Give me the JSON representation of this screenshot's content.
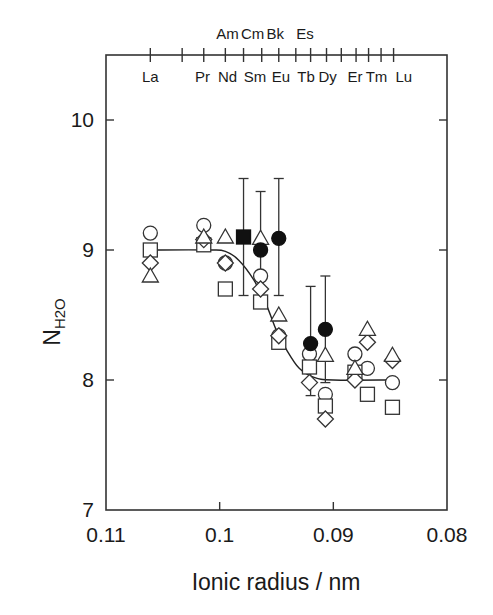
{
  "chart_data": {
    "type": "scatter",
    "title": "",
    "xlabel": "Ionic radius / nm",
    "ylabel_main": "N",
    "ylabel_sub": "H2O",
    "xlim": [
      0.11,
      0.08
    ],
    "ylim": [
      7,
      10.5
    ],
    "xticks": [
      {
        "value": 0.11,
        "label": "0.11"
      },
      {
        "value": 0.1,
        "label": "0.1"
      },
      {
        "value": 0.09,
        "label": "0.09"
      },
      {
        "value": 0.08,
        "label": "0.08"
      }
    ],
    "yticks": [
      {
        "value": 7,
        "label": "7"
      },
      {
        "value": 8,
        "label": "8"
      },
      {
        "value": 9,
        "label": "9"
      },
      {
        "value": 10,
        "label": "10"
      }
    ],
    "top_axis": {
      "tick_radii": [
        0.1061,
        0.1033,
        0.1014,
        0.0995,
        0.0979,
        0.0963,
        0.0948,
        0.0933,
        0.092,
        0.0906,
        0.0893,
        0.088,
        0.0869,
        0.0858,
        0.0847
      ],
      "lanthanide_labels": [
        {
          "label": "La",
          "r": 0.1061
        },
        {
          "label": "Pr",
          "r": 0.1015
        },
        {
          "label": "Nd",
          "r": 0.0993
        },
        {
          "label": "Sm",
          "r": 0.0969
        },
        {
          "label": "Eu",
          "r": 0.0946
        },
        {
          "label": "Tb",
          "r": 0.0924
        },
        {
          "label": "Dy",
          "r": 0.0905
        },
        {
          "label": "Er",
          "r": 0.0881
        },
        {
          "label": "Tm",
          "r": 0.0862
        },
        {
          "label": "Lu",
          "r": 0.0838
        }
      ],
      "actinide_labels": [
        {
          "label": "Am",
          "r": 0.0993
        },
        {
          "label": "Cm",
          "r": 0.0971
        },
        {
          "label": "Bk",
          "r": 0.0951
        },
        {
          "label": "Es",
          "r": 0.0925
        }
      ]
    },
    "series": [
      {
        "name": "open-circle",
        "marker": "circle",
        "filled": false,
        "points": [
          {
            "x": 0.1061,
            "y": 9.13
          },
          {
            "x": 0.1014,
            "y": 9.19
          },
          {
            "x": 0.0995,
            "y": 8.9
          },
          {
            "x": 0.0964,
            "y": 8.8
          },
          {
            "x": 0.0948,
            "y": 8.34
          },
          {
            "x": 0.0921,
            "y": 8.2
          },
          {
            "x": 0.0907,
            "y": 7.89
          },
          {
            "x": 0.0881,
            "y": 8.2
          },
          {
            "x": 0.087,
            "y": 8.09
          },
          {
            "x": 0.0848,
            "y": 7.98
          }
        ]
      },
      {
        "name": "open-square",
        "marker": "square",
        "filled": false,
        "points": [
          {
            "x": 0.1061,
            "y": 9.0
          },
          {
            "x": 0.1014,
            "y": 9.04
          },
          {
            "x": 0.0995,
            "y": 8.7
          },
          {
            "x": 0.0964,
            "y": 8.6
          },
          {
            "x": 0.0948,
            "y": 8.29
          },
          {
            "x": 0.0921,
            "y": 8.1
          },
          {
            "x": 0.0907,
            "y": 7.8
          },
          {
            "x": 0.0881,
            "y": 8.06
          },
          {
            "x": 0.087,
            "y": 7.89
          },
          {
            "x": 0.0848,
            "y": 7.79
          }
        ]
      },
      {
        "name": "open-diamond",
        "marker": "diamond",
        "filled": false,
        "points": [
          {
            "x": 0.1061,
            "y": 8.9
          },
          {
            "x": 0.1014,
            "y": 9.08
          },
          {
            "x": 0.0995,
            "y": 8.9
          },
          {
            "x": 0.0964,
            "y": 8.7
          },
          {
            "x": 0.0948,
            "y": 8.34
          },
          {
            "x": 0.0921,
            "y": 7.98
          },
          {
            "x": 0.0907,
            "y": 7.7
          },
          {
            "x": 0.0881,
            "y": 8.0
          },
          {
            "x": 0.087,
            "y": 8.29
          },
          {
            "x": 0.0848,
            "y": 8.15
          }
        ]
      },
      {
        "name": "open-triangle",
        "marker": "triangle",
        "filled": false,
        "points": [
          {
            "x": 0.1061,
            "y": 8.8
          },
          {
            "x": 0.1014,
            "y": 9.1
          },
          {
            "x": 0.0995,
            "y": 9.1
          },
          {
            "x": 0.0964,
            "y": 9.09
          },
          {
            "x": 0.0948,
            "y": 8.5
          },
          {
            "x": 0.0907,
            "y": 8.19
          },
          {
            "x": 0.0881,
            "y": 8.09
          },
          {
            "x": 0.087,
            "y": 8.39
          },
          {
            "x": 0.0848,
            "y": 8.19
          }
        ]
      },
      {
        "name": "filled-square-Am",
        "marker": "square",
        "filled": true,
        "points": [
          {
            "x": 0.0979,
            "y": 9.1,
            "err_low": 8.65,
            "err_high": 9.55
          }
        ]
      },
      {
        "name": "filled-circle-actinides",
        "marker": "circle",
        "filled": true,
        "points": [
          {
            "x": 0.0964,
            "y": 9.0,
            "err_low": 8.56,
            "err_high": 9.45
          },
          {
            "x": 0.0948,
            "y": 9.09,
            "err_low": 8.65,
            "err_high": 9.55
          },
          {
            "x": 0.092,
            "y": 8.28,
            "err_low": 7.88,
            "err_high": 8.72
          },
          {
            "x": 0.0907,
            "y": 8.39,
            "err_low": 7.98,
            "err_high": 8.8
          }
        ]
      }
    ],
    "fit_curve": {
      "points": [
        {
          "x": 0.1063,
          "y": 9.0
        },
        {
          "x": 0.101,
          "y": 9.0
        },
        {
          "x": 0.0995,
          "y": 8.99
        },
        {
          "x": 0.0983,
          "y": 8.92
        },
        {
          "x": 0.097,
          "y": 8.77
        },
        {
          "x": 0.0959,
          "y": 8.58
        },
        {
          "x": 0.095,
          "y": 8.38
        },
        {
          "x": 0.0941,
          "y": 8.23
        },
        {
          "x": 0.093,
          "y": 8.09
        },
        {
          "x": 0.0917,
          "y": 8.02
        },
        {
          "x": 0.09,
          "y": 8.0
        },
        {
          "x": 0.0848,
          "y": 8.0
        }
      ]
    },
    "grid": false,
    "legend": "none"
  }
}
